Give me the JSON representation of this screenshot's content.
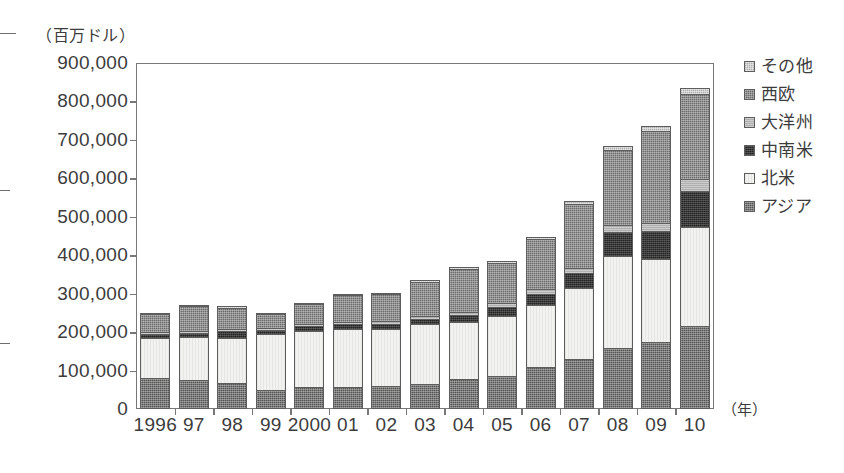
{
  "chart_data": {
    "type": "bar",
    "subtype": "stacked-bar",
    "title": "",
    "unit_caption": "（百万ドル）",
    "xlabel": "（年）",
    "ylabel": "",
    "ylim": [
      0,
      900000
    ],
    "ytick_step": 100000,
    "grid": false,
    "legend_position": "right",
    "ytick_labels": [
      "900,000",
      "800,000",
      "700,000",
      "600,000",
      "500,000",
      "400,000",
      "300,000",
      "200,000",
      "100,000",
      "0"
    ],
    "ytick_values": [
      900000,
      800000,
      700000,
      600000,
      500000,
      400000,
      300000,
      200000,
      100000,
      0
    ],
    "categories": [
      "1996",
      "97",
      "98",
      "99",
      "2000",
      "01",
      "02",
      "03",
      "04",
      "05",
      "06",
      "07",
      "08",
      "09",
      "10"
    ],
    "stack_order_bottom_to_top": [
      "アジア",
      "北米",
      "中南米",
      "大洋州",
      "西欧",
      "その他"
    ],
    "series": [
      {
        "name": "アジア",
        "key": "asia",
        "color": "#555555",
        "pattern": "crosshatch-dark",
        "values": [
          80000,
          75000,
          68000,
          50000,
          58000,
          58000,
          60000,
          65000,
          78000,
          85000,
          110000,
          130000,
          158000,
          175000,
          215000
        ]
      },
      {
        "name": "北米",
        "key": "nam",
        "color": "#f2f2f0",
        "pattern": "white",
        "values": [
          105000,
          112000,
          118000,
          145000,
          145000,
          150000,
          148000,
          155000,
          148000,
          158000,
          160000,
          185000,
          240000,
          215000,
          258000
        ]
      },
      {
        "name": "中南米",
        "key": "latam",
        "color": "#242424",
        "pattern": "solid-near-black",
        "values": [
          10000,
          10000,
          18000,
          10000,
          12000,
          12000,
          14000,
          15000,
          18000,
          22000,
          30000,
          38000,
          62000,
          72000,
          95000
        ]
      },
      {
        "name": "大洋州",
        "key": "oceania",
        "color": "#b0b0b0",
        "pattern": "light-gray",
        "values": [
          5000,
          5000,
          5000,
          5000,
          6000,
          6000,
          7000,
          8000,
          9000,
          10000,
          12000,
          15000,
          18000,
          22000,
          30000
        ]
      },
      {
        "name": "西欧",
        "key": "weur",
        "color": "#6b6b6b",
        "pattern": "crosshatch-medium",
        "values": [
          48000,
          65000,
          55000,
          38000,
          52000,
          70000,
          70000,
          88000,
          112000,
          105000,
          130000,
          165000,
          195000,
          240000,
          222000
        ]
      },
      {
        "name": "その他",
        "key": "other",
        "color": "#cfcfcf",
        "pattern": "dotted-light",
        "values": [
          2000,
          3000,
          3000,
          2000,
          3000,
          4000,
          4000,
          5000,
          5000,
          5000,
          6000,
          8000,
          10000,
          12000,
          14000
        ]
      }
    ],
    "totals": [
      250000,
      270000,
      267000,
      250000,
      276000,
      300000,
      303000,
      336000,
      370000,
      385000,
      448000,
      541000,
      683000,
      736000,
      834000
    ]
  },
  "legend": {
    "items": [
      {
        "label": "その他",
        "key": "other"
      },
      {
        "label": "西欧",
        "key": "weur"
      },
      {
        "label": "大洋州",
        "key": "oceania"
      },
      {
        "label": "中南米",
        "key": "latam"
      },
      {
        "label": "北米",
        "key": "nam"
      },
      {
        "label": "アジア",
        "key": "asia"
      }
    ]
  }
}
